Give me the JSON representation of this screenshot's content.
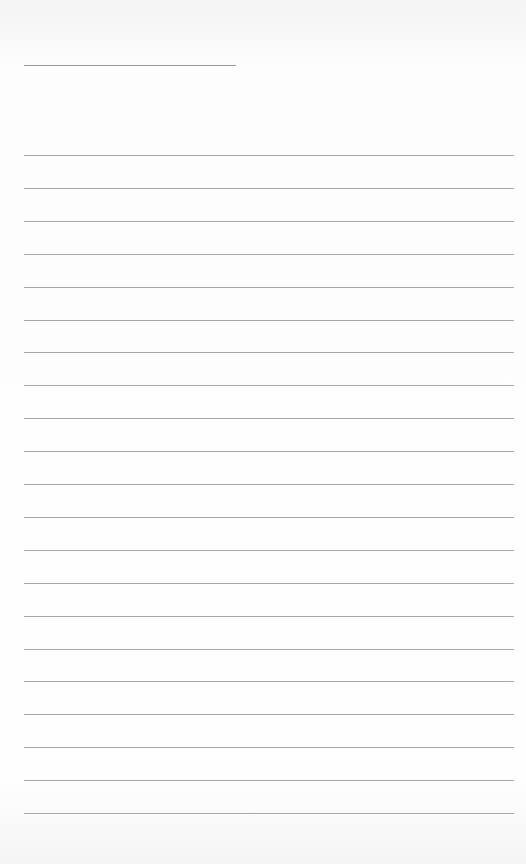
{
  "document": {
    "type": "lined-paper",
    "title_line": {
      "text": ""
    },
    "ruled_lines": {
      "count": 21,
      "first_y": 155,
      "spacing": 32.9,
      "values": [
        "",
        "",
        "",
        "",
        "",
        "",
        "",
        "",
        "",
        "",
        "",
        "",
        "",
        "",
        "",
        "",
        "",
        "",
        "",
        "",
        ""
      ]
    },
    "colors": {
      "paper": "#fbfbfb",
      "line": "#a8a8a8"
    }
  }
}
